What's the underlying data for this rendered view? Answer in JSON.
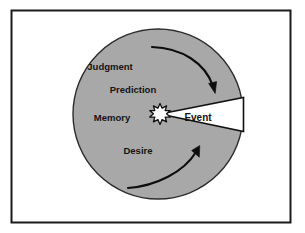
{
  "figure": {
    "frame": {
      "border_color": "#1a1a1a",
      "background_color": "#ffffff"
    },
    "circle": {
      "fill_color": "#a8a8a8",
      "stroke_color": "#2b2b2b",
      "center_x": 158,
      "center_y": 114,
      "radius": 85
    },
    "center_icon": {
      "name": "starburst-icon",
      "fill_color": "#ffffff",
      "stroke_color": "#111111"
    },
    "wedge": {
      "label": "Event",
      "fill_color": "#ffffff",
      "stroke_color": "#111111"
    },
    "segments": [
      {
        "label": "Judgment",
        "x": 110,
        "y": 67
      },
      {
        "label": "Prediction",
        "x": 133,
        "y": 90
      },
      {
        "label": "Memory",
        "x": 112,
        "y": 118
      },
      {
        "label": "Desire",
        "x": 138,
        "y": 151
      }
    ],
    "arrows": [
      {
        "name": "top-arrow-clockwise",
        "direction": "clockwise",
        "color": "#0d0d0d"
      },
      {
        "name": "bottom-arrow-counterclockwise",
        "direction": "counterclockwise",
        "color": "#0d0d0d"
      }
    ]
  }
}
